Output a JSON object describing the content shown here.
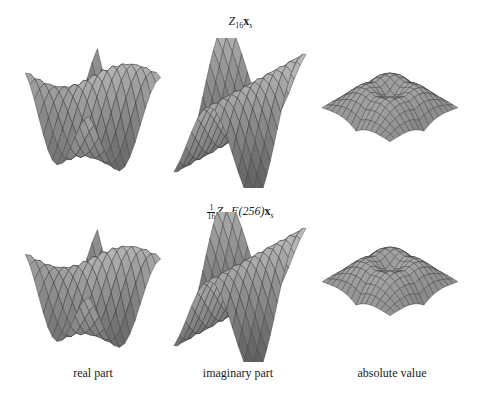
{
  "figure": {
    "row_titles": [
      {
        "main": "Z",
        "sub": "16",
        "vec": "x",
        "vec_sub": "s",
        "label_text": "Z_16 x_s"
      },
      {
        "frac_num": "1",
        "frac_den": "16",
        "main": "Z",
        "sub": "16",
        "op": "F(256)",
        "vec": "x",
        "vec_sub": "s",
        "label_text": "1/16 Z_16 F(256) x_s"
      }
    ],
    "column_captions": [
      "real part",
      "imaginary part",
      "absolute value"
    ],
    "panels": [
      {
        "row": 0,
        "col": 0,
        "kind": "real",
        "description": "3D surface plot, saddle-like, grayscale shaded mesh"
      },
      {
        "row": 0,
        "col": 1,
        "kind": "imag",
        "description": "3D surface plot, peaked ridge, grayscale shaded mesh"
      },
      {
        "row": 0,
        "col": 2,
        "kind": "abs",
        "description": "3D surface plot, four-cornered with downward point, grayscale shaded mesh"
      },
      {
        "row": 1,
        "col": 0,
        "kind": "real",
        "description": "3D surface plot, saddle-like, grayscale shaded mesh"
      },
      {
        "row": 1,
        "col": 1,
        "kind": "imag",
        "description": "3D surface plot, peaked ridge, grayscale shaded mesh"
      },
      {
        "row": 1,
        "col": 2,
        "kind": "abs",
        "description": "3D surface plot, four-cornered with downward point, grayscale shaded mesh"
      }
    ],
    "colors": {
      "mesh_line": "#333333",
      "dark": "#3a3a3a",
      "light": "#d8d8d8"
    }
  }
}
